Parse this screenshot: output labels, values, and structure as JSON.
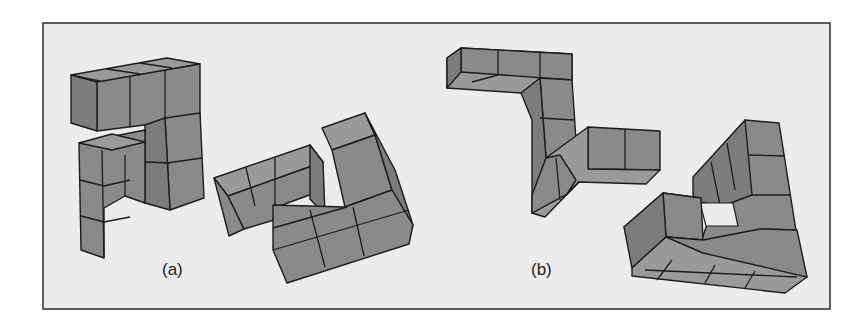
{
  "figure": {
    "panels": [
      {
        "id": "a",
        "label": "(a)",
        "description": "Pair of 3D block shapes made of unit cubes (mental rotation task)"
      },
      {
        "id": "b",
        "label": "(b)",
        "description": "Pair of 3D block shapes made of unit cubes (mental rotation task)"
      }
    ],
    "colors": {
      "background": "#ececec",
      "cube_face": "#8a8a8a",
      "edge": "#1c1c1c",
      "frame": "#3a3a3a"
    }
  }
}
